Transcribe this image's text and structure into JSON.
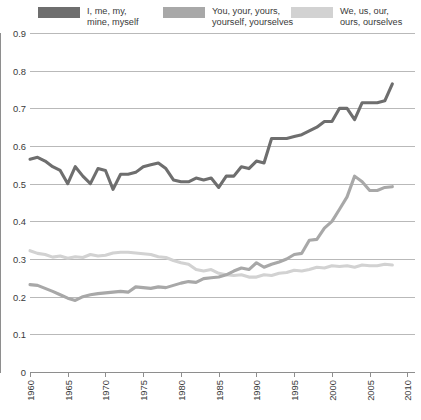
{
  "legend": {
    "items": [
      {
        "label": "I, me, my,\nmine, myself",
        "color": "#6e6e6e",
        "name": "legend-item-i-me-my"
      },
      {
        "label": "You, your, yours,\nyourself, yourselves",
        "color": "#a8a8a8",
        "name": "legend-item-you-your-yours"
      },
      {
        "label": "We, us, our,\nours, ourselves",
        "color": "#d2d2d2",
        "name": "legend-item-we-us-our"
      }
    ]
  },
  "axes": {
    "y_ticks": [
      "0",
      "0.1",
      "0.2",
      "0.3",
      "0.4",
      "0.5",
      "0.6",
      "0.7",
      "0.8",
      "0.9"
    ],
    "x_ticks": [
      "1960",
      "1965",
      "1970",
      "1975",
      "1980",
      "1985",
      "1990",
      "1995",
      "2000",
      "2005",
      "2010"
    ]
  },
  "chart_data": {
    "type": "line",
    "title": "",
    "subtitle": "",
    "xlabel": "",
    "ylabel": "",
    "xlim": [
      1960,
      2011
    ],
    "ylim": [
      0,
      0.9
    ],
    "grid": true,
    "legend_position": "top",
    "x": [
      1960,
      1961,
      1962,
      1963,
      1964,
      1965,
      1966,
      1967,
      1968,
      1969,
      1970,
      1971,
      1972,
      1973,
      1974,
      1975,
      1976,
      1977,
      1978,
      1979,
      1980,
      1981,
      1982,
      1983,
      1984,
      1985,
      1986,
      1987,
      1988,
      1989,
      1990,
      1991,
      1992,
      1993,
      1994,
      1995,
      1996,
      1997,
      1998,
      1999,
      2000,
      2001,
      2002,
      2003,
      2004,
      2005,
      2006,
      2007,
      2008
    ],
    "series": [
      {
        "name": "I, me, my, mine, myself",
        "color": "#6e6e6e",
        "values": [
          0.565,
          0.57,
          0.56,
          0.545,
          0.535,
          0.5,
          0.545,
          0.52,
          0.5,
          0.54,
          0.535,
          0.485,
          0.525,
          0.525,
          0.53,
          0.545,
          0.55,
          0.555,
          0.54,
          0.51,
          0.505,
          0.505,
          0.515,
          0.51,
          0.515,
          0.49,
          0.52,
          0.52,
          0.545,
          0.54,
          0.56,
          0.555,
          0.62,
          0.62,
          0.62,
          0.625,
          0.63,
          0.64,
          0.65,
          0.665,
          0.665,
          0.7,
          0.7,
          0.67,
          0.715,
          0.715,
          0.715,
          0.72,
          0.765
        ]
      },
      {
        "name": "You, your, yours, yourself, yourselves",
        "color": "#a8a8a8",
        "values": [
          0.232,
          0.23,
          0.222,
          0.214,
          0.205,
          0.196,
          0.19,
          0.2,
          0.205,
          0.208,
          0.21,
          0.212,
          0.214,
          0.212,
          0.226,
          0.224,
          0.222,
          0.226,
          0.224,
          0.23,
          0.236,
          0.24,
          0.238,
          0.248,
          0.25,
          0.252,
          0.258,
          0.268,
          0.276,
          0.272,
          0.29,
          0.278,
          0.286,
          0.292,
          0.3,
          0.312,
          0.315,
          0.35,
          0.352,
          0.382,
          0.4,
          0.432,
          0.465,
          0.52,
          0.505,
          0.482,
          0.482,
          0.49,
          0.492
        ]
      },
      {
        "name": "We, us, our, ours, ourselves",
        "color": "#d2d2d2",
        "values": [
          0.322,
          0.315,
          0.312,
          0.305,
          0.308,
          0.302,
          0.306,
          0.304,
          0.312,
          0.308,
          0.31,
          0.316,
          0.318,
          0.318,
          0.316,
          0.314,
          0.312,
          0.306,
          0.304,
          0.296,
          0.29,
          0.286,
          0.272,
          0.268,
          0.272,
          0.262,
          0.258,
          0.256,
          0.258,
          0.252,
          0.252,
          0.258,
          0.256,
          0.262,
          0.264,
          0.27,
          0.268,
          0.272,
          0.278,
          0.276,
          0.282,
          0.28,
          0.282,
          0.278,
          0.284,
          0.282,
          0.282,
          0.286,
          0.284
        ]
      }
    ]
  }
}
